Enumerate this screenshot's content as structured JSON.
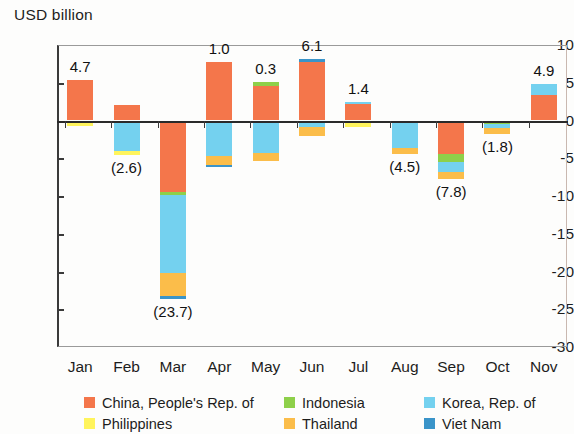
{
  "axis_unit_label": "USD billion",
  "chart_data": {
    "type": "bar",
    "subtype": "stacked-bar-diverging",
    "title": "",
    "subtitle": "",
    "xlabel": "",
    "ylabel": "USD billion",
    "ylim": [
      -30,
      10
    ],
    "ytick_step": 5,
    "yticks": [
      10,
      5,
      0,
      -5,
      -10,
      -15,
      -20,
      -25,
      -30
    ],
    "ytick_labels": [
      "10",
      "5",
      "0",
      "-5",
      "-10",
      "-15",
      "-20",
      "-25",
      "-30"
    ],
    "grid": false,
    "legend_position": "bottom",
    "categories": [
      "Jan",
      "Feb",
      "Mar",
      "Apr",
      "May",
      "Jun",
      "Jul",
      "Aug",
      "Sep",
      "Oct",
      "Nov"
    ],
    "series": [
      {
        "name": "China, People's Rep. of",
        "color": "#f4764b",
        "values": [
          5.4,
          2.0,
          -9.5,
          7.7,
          4.6,
          7.8,
          2.2,
          0.0,
          -4.5,
          0.0,
          3.4
        ]
      },
      {
        "name": "Indonesia",
        "color": "#8ed04a",
        "values": [
          0.0,
          0.0,
          -0.4,
          0.0,
          0.5,
          0.0,
          0.0,
          -0.3,
          -1.0,
          -0.5,
          0.0
        ]
      },
      {
        "name": "Korea, Rep. of",
        "color": "#74d1ef",
        "values": [
          0.0,
          -4.0,
          -10.3,
          -4.7,
          -4.3,
          -0.8,
          0.3,
          -3.3,
          -1.3,
          -0.5,
          1.5
        ]
      },
      {
        "name": "Philippines",
        "color": "#fff45c",
        "values": [
          -0.7,
          -0.6,
          0.0,
          0.0,
          0.0,
          0.0,
          -0.9,
          0.0,
          0.0,
          0.0,
          0.0
        ]
      },
      {
        "name": "Thailand",
        "color": "#fbbd4a",
        "values": [
          0.0,
          0.0,
          -3.1,
          -1.2,
          -1.0,
          -1.2,
          0.0,
          -0.9,
          -1.0,
          -0.8,
          0.0
        ]
      },
      {
        "name": "Viet Nam",
        "color": "#3a94c9",
        "values": [
          0.0,
          0.0,
          -0.4,
          -0.3,
          0.0,
          0.4,
          0.0,
          0.0,
          0.0,
          0.0,
          0.0
        ]
      }
    ],
    "net_totals": [
      4.7,
      -2.6,
      -23.7,
      1.0,
      0.3,
      6.1,
      1.4,
      -4.5,
      -7.8,
      -1.8,
      4.9
    ],
    "net_total_labels": [
      "4.7",
      "(2.6)",
      "(23.7)",
      "1.0",
      "0.3",
      "6.1",
      "1.4",
      "(4.5)",
      "(7.8)",
      "(1.8)",
      "4.9"
    ],
    "note": "Values in parentheses are negative"
  },
  "legend": [
    {
      "label": "China, People's Rep. of",
      "color": "#f4764b"
    },
    {
      "label": "Indonesia",
      "color": "#8ed04a"
    },
    {
      "label": "Korea, Rep. of",
      "color": "#74d1ef"
    },
    {
      "label": "Philippines",
      "color": "#fff45c"
    },
    {
      "label": "Thailand",
      "color": "#fbbd4a"
    },
    {
      "label": "Viet Nam",
      "color": "#3a94c9"
    }
  ],
  "legend_order": [
    0,
    1,
    2,
    3,
    4,
    5
  ]
}
